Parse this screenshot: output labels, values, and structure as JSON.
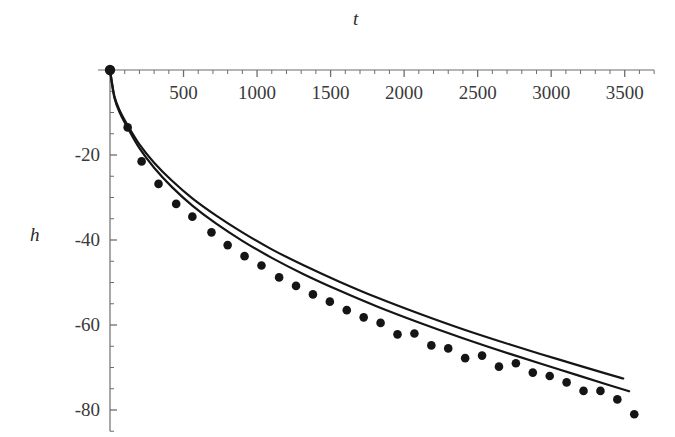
{
  "chart_data": {
    "type": "scatter",
    "title": "t",
    "xlabel": "t",
    "ylabel": "h",
    "grid": false,
    "legend": "none",
    "xlim": [
      0,
      3700
    ],
    "ylim": [
      -85,
      2
    ],
    "x_major_ticks": [
      500,
      1000,
      1500,
      2000,
      2500,
      3000,
      3500
    ],
    "x_major_tick_labels": [
      "500",
      "1000",
      "1500",
      "2000",
      "2500",
      "3000",
      "3500"
    ],
    "x_minor_tick_step": 100,
    "y_major_ticks": [
      -20,
      -40,
      -60,
      -80
    ],
    "y_major_tick_labels": [
      "-20",
      "-40",
      "-60",
      "-80"
    ],
    "y_minor_tick_step": 5,
    "axis_origin": [
      0,
      0
    ],
    "series": [
      {
        "name": "measured-data-points",
        "type": "scatter",
        "marker": "filled-circle",
        "color": "#151515",
        "points": [
          [
            0,
            0
          ],
          [
            120,
            -13.5
          ],
          [
            215,
            -21.5
          ],
          [
            330,
            -26.8
          ],
          [
            450,
            -31.5
          ],
          [
            560,
            -34.5
          ],
          [
            690,
            -38.2
          ],
          [
            800,
            -41.2
          ],
          [
            915,
            -43.8
          ],
          [
            1030,
            -46.0
          ],
          [
            1150,
            -48.8
          ],
          [
            1265,
            -50.8
          ],
          [
            1380,
            -52.8
          ],
          [
            1495,
            -54.5
          ],
          [
            1610,
            -56.5
          ],
          [
            1725,
            -58.2
          ],
          [
            1840,
            -59.5
          ],
          [
            1955,
            -62.2
          ],
          [
            2070,
            -62.0
          ],
          [
            2185,
            -64.8
          ],
          [
            2300,
            -65.5
          ],
          [
            2415,
            -67.8
          ],
          [
            2530,
            -67.2
          ],
          [
            2645,
            -69.8
          ],
          [
            2760,
            -69.0
          ],
          [
            2875,
            -71.2
          ],
          [
            2990,
            -72.0
          ],
          [
            3105,
            -73.5
          ],
          [
            3220,
            -75.5
          ],
          [
            3335,
            -75.5
          ],
          [
            3450,
            -77.5
          ],
          [
            3565,
            -81.0
          ]
        ]
      },
      {
        "name": "model-curve-upper",
        "type": "line",
        "color": "#151515",
        "points": [
          [
            0,
            0
          ],
          [
            30,
            -6.2
          ],
          [
            70,
            -9.8
          ],
          [
            120,
            -13.0
          ],
          [
            200,
            -17.5
          ],
          [
            300,
            -21.8
          ],
          [
            420,
            -26.0
          ],
          [
            560,
            -30.2
          ],
          [
            720,
            -34.2
          ],
          [
            900,
            -38.2
          ],
          [
            1100,
            -42.2
          ],
          [
            1320,
            -46.0
          ],
          [
            1560,
            -49.8
          ],
          [
            1820,
            -53.6
          ],
          [
            2100,
            -57.3
          ],
          [
            2400,
            -61.0
          ],
          [
            2720,
            -64.6
          ],
          [
            3050,
            -68.1
          ],
          [
            3380,
            -71.5
          ],
          [
            3490,
            -72.6
          ]
        ]
      },
      {
        "name": "model-curve-lower",
        "type": "line",
        "color": "#151515",
        "points": [
          [
            0,
            0
          ],
          [
            30,
            -6.5
          ],
          [
            70,
            -10.3
          ],
          [
            120,
            -13.6
          ],
          [
            200,
            -18.4
          ],
          [
            300,
            -23.0
          ],
          [
            420,
            -27.5
          ],
          [
            560,
            -31.9
          ],
          [
            720,
            -36.1
          ],
          [
            900,
            -40.2
          ],
          [
            1100,
            -44.2
          ],
          [
            1320,
            -48.1
          ],
          [
            1560,
            -51.9
          ],
          [
            1820,
            -55.7
          ],
          [
            2100,
            -59.4
          ],
          [
            2400,
            -63.1
          ],
          [
            2720,
            -66.8
          ],
          [
            3050,
            -70.4
          ],
          [
            3380,
            -74.0
          ],
          [
            3530,
            -75.6
          ]
        ]
      }
    ]
  }
}
